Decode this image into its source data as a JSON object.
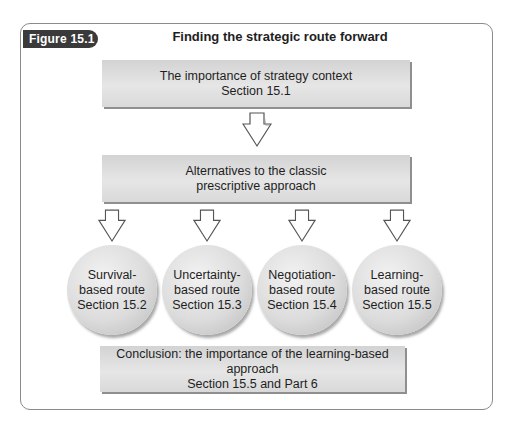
{
  "figure": {
    "label": "Figure 15.1",
    "title": "Finding the strategic route forward"
  },
  "top_box": {
    "line1": "The importance of strategy context",
    "line2": "Section 15.1"
  },
  "middle_box": {
    "line1": "Alternatives to the classic",
    "line2": "prescriptive approach"
  },
  "routes": [
    {
      "line1": "Survival-",
      "line2": "based route",
      "line3": "Section 15.2"
    },
    {
      "line1": "Uncertainty-",
      "line2": "based route",
      "line3": "Section 15.3"
    },
    {
      "line1": "Negotiation-",
      "line2": "based route",
      "line3": "Section 15.4"
    },
    {
      "line1": "Learning-",
      "line2": "based route",
      "line3": "Section 15.5"
    }
  ],
  "bottom_box": {
    "line1": "Conclusion: the importance of the learning-based approach",
    "line2": "Section 15.5 and Part 6"
  },
  "colors": {
    "tab_fill": "#3a3a3a",
    "box_fill": "#dcdcdc",
    "frame_border": "#8a8a8a"
  }
}
